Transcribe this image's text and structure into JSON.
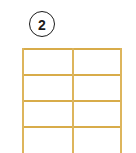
{
  "figure": {
    "background_color": "#ffffff",
    "width": 136,
    "height": 153
  },
  "step_badge": {
    "number": "2",
    "shape": "circle",
    "stroke_color": "#1b1b1b",
    "fill_color": "#ffffff",
    "diameter_px": 26,
    "position": {
      "x": 29,
      "y": 11
    }
  },
  "grid": {
    "name": "ruled-grid",
    "line_color": "#d8ac4a",
    "line_width_px": 1.7,
    "columns": 2,
    "visible_rows": 4,
    "clipped_at_bottom": true,
    "bounds": {
      "left": 22,
      "top": 48,
      "right": 122,
      "width": 100
    },
    "horizontal_line_y": [
      0,
      26,
      52,
      78
    ],
    "vertical_line_x": [
      0,
      50,
      98
    ],
    "cells": [
      {
        "row": 1,
        "col": 1,
        "value": ""
      },
      {
        "row": 1,
        "col": 2,
        "value": ""
      },
      {
        "row": 2,
        "col": 1,
        "value": ""
      },
      {
        "row": 2,
        "col": 2,
        "value": ""
      },
      {
        "row": 3,
        "col": 1,
        "value": ""
      },
      {
        "row": 3,
        "col": 2,
        "value": ""
      },
      {
        "row": 4,
        "col": 1,
        "value": ""
      },
      {
        "row": 4,
        "col": 2,
        "value": ""
      }
    ]
  }
}
